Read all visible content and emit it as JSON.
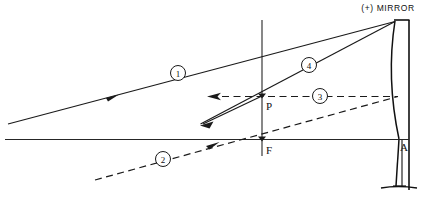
{
  "figure": {
    "mirror_label": "(+) MIRROR",
    "points": {
      "p_label": "P",
      "f_label": "F",
      "a_label": "A"
    },
    "ray_tags": [
      {
        "id": "1",
        "label": "1",
        "cx": 178,
        "cy": 73,
        "style": "solid"
      },
      {
        "id": "2",
        "label": "2",
        "cx": 163,
        "cy": 159,
        "style": "dashed"
      },
      {
        "id": "3",
        "label": "3",
        "cx": 320,
        "cy": 96,
        "style": "dashed"
      },
      {
        "id": "4",
        "label": "4",
        "cx": 309,
        "cy": 65,
        "style": "solid"
      }
    ],
    "colors": {
      "ink": "#1a1a1a",
      "axis": "#262626",
      "background": "#ffffff"
    },
    "geometry": {
      "axis_y": 139,
      "vertical_x": 262,
      "vertex_x": 399,
      "p_y": 96,
      "mirror_top_y": 20,
      "mirror_bottom_y": 190
    }
  }
}
